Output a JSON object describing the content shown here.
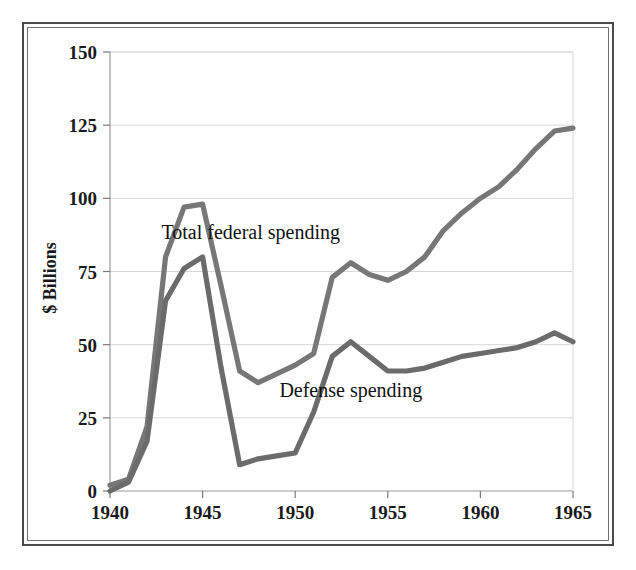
{
  "figure": {
    "frame_color": "#4a4a4a",
    "background": "#ffffff"
  },
  "chart_data": {
    "type": "line",
    "title": "",
    "subtitle": "",
    "xlabel": "",
    "ylabel": "$ Billions",
    "xlim": [
      1940,
      1965
    ],
    "ylim": [
      0,
      150
    ],
    "grid": true,
    "legend_position": "inline-annotation",
    "x_tick_labels": [
      "1940",
      "1945",
      "1950",
      "1955",
      "1960",
      "1965"
    ],
    "x_ticks": [
      1940,
      1945,
      1950,
      1955,
      1960,
      1965
    ],
    "y_tick_labels": [
      "0",
      "25",
      "50",
      "75",
      "100",
      "125",
      "150"
    ],
    "y_ticks": [
      0,
      25,
      50,
      75,
      100,
      125,
      150
    ],
    "x": [
      1940,
      1941,
      1942,
      1943,
      1944,
      1945,
      1946,
      1947,
      1948,
      1949,
      1950,
      1951,
      1952,
      1953,
      1954,
      1955,
      1956,
      1957,
      1958,
      1959,
      1960,
      1961,
      1962,
      1963,
      1964,
      1965
    ],
    "series": [
      {
        "name": "Total federal spending",
        "color": "#777777",
        "label_text": "Total federal spending",
        "label_x": 1947.6,
        "label_y": 86,
        "values": [
          9.5,
          13.7,
          35.1,
          78.6,
          91.3,
          92.7,
          55.2,
          34.5,
          29.8,
          38.8,
          42.6,
          45.5,
          67.7,
          76.1,
          70.9,
          68.4,
          70.6,
          76.6,
          82.4,
          92.1,
          92.2,
          97.7,
          106.8,
          111.3,
          118.5,
          118.2
        ],
        "plotted_pixel_values": [
          2,
          4,
          22,
          80,
          97,
          98,
          70,
          41,
          37,
          40,
          43,
          47,
          73,
          78,
          74,
          72,
          75,
          80,
          89,
          95,
          100,
          104,
          110,
          117,
          123,
          124
        ]
      },
      {
        "name": "Defense spending",
        "color": "#6b6b6b",
        "label_text": "Defense spending",
        "label_x": 1953.0,
        "label_y": 32,
        "values": [
          1.7,
          6.4,
          25.7,
          66.7,
          79.1,
          83.0,
          42.7,
          12.8,
          9.1,
          13.2,
          13.7,
          23.6,
          46.1,
          48.7,
          41.2,
          39.9,
          40.3,
          43.3,
          44.2,
          46.5,
          45.7,
          47.4,
          51.1,
          52.3,
          53.6,
          50.6
        ],
        "plotted_pixel_values": [
          0,
          3,
          17,
          65,
          76,
          80,
          42,
          9,
          11,
          12,
          13,
          27,
          46,
          51,
          46,
          41,
          41,
          42,
          44,
          46,
          47,
          48,
          49,
          51,
          54,
          51
        ]
      }
    ]
  }
}
